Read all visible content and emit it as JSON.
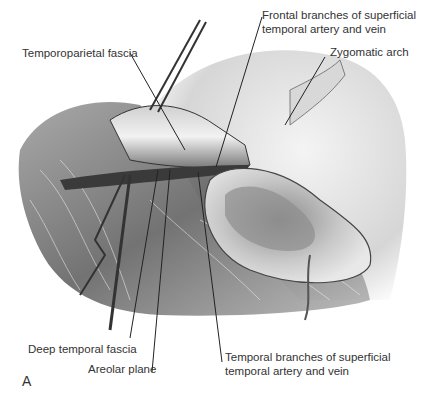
{
  "figure": {
    "panel_letter": "A",
    "labels": {
      "frontal_branches_line1": "Frontal branches of superficial",
      "frontal_branches_line2": "temporal artery and vein",
      "zygomatic_arch": "Zygomatic arch",
      "temporoparietal_fascia": "Temporoparietal fascia",
      "deep_temporal_fascia": "Deep temporal fascia",
      "areolar_plane": "Areolar plane",
      "temporal_branches_line1": "Temporal branches of superficial",
      "temporal_branches_line2": "temporal artery and vein"
    }
  }
}
